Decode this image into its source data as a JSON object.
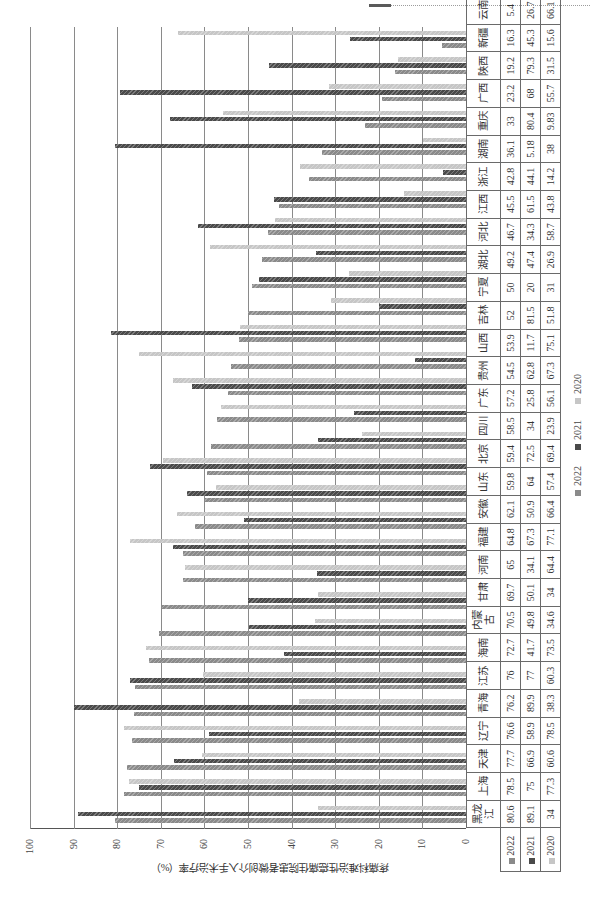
{
  "chart_data": {
    "type": "bar",
    "orientation": "grouped vertical bars; entire figure rotated 90° counter-clockwise on the page",
    "title": "",
    "xlabel": "",
    "ylabel": "疼痛科难治性癌痛住院患者微创介入手术治疗率（%）",
    "ylim": [
      0,
      100
    ],
    "yticks": [
      0,
      10,
      20,
      30,
      40,
      50,
      60,
      70,
      80,
      90,
      100
    ],
    "grid": true,
    "legend_position": "bottom",
    "data_table": true,
    "categories": [
      "黑龙江",
      "上海",
      "天津",
      "辽宁",
      "青海",
      "江苏",
      "海南",
      "内蒙古",
      "甘肃",
      "河南",
      "福建",
      "安徽",
      "山东",
      "北京",
      "四川",
      "广东",
      "贵州",
      "山西",
      "吉林",
      "宁夏",
      "湖北",
      "河北",
      "江西",
      "浙江",
      "湖南",
      "重庆",
      "广西",
      "陕西",
      "新疆",
      "云南"
    ],
    "series": [
      {
        "name": "2022",
        "color": "#8a8a8a",
        "values": [
          80.6,
          78.5,
          77.7,
          76.6,
          76.2,
          76,
          72.7,
          70.5,
          69.7,
          65,
          64.8,
          62.1,
          59.8,
          59.4,
          58.5,
          57.2,
          54.5,
          53.9,
          52,
          50,
          49.2,
          46.7,
          45.5,
          42.8,
          36.1,
          33,
          23.2,
          19.2,
          16.3,
          5.4
        ]
      },
      {
        "name": "2021",
        "color": "#4a4a4a",
        "values": [
          89.1,
          75,
          66.9,
          58.9,
          89.9,
          77,
          41.7,
          49.8,
          50.1,
          34.1,
          67.3,
          50.9,
          64,
          72.5,
          34,
          25.8,
          62.8,
          11.7,
          81.5,
          20,
          47.4,
          34.3,
          61.5,
          44.1,
          5.18,
          80.4,
          68,
          79.3,
          45.3,
          26.7
        ]
      },
      {
        "name": "2020",
        "color": "#c6c6c6",
        "values": [
          34,
          77.3,
          60.6,
          78.5,
          38.3,
          60.3,
          73.5,
          34.6,
          34,
          64.4,
          77.1,
          66.4,
          57.4,
          69.4,
          23.9,
          56.1,
          67.3,
          75.1,
          51.8,
          31,
          26.9,
          58.7,
          43.8,
          14.2,
          38,
          9.83,
          55.7,
          31.5,
          15.6,
          66.1
        ]
      }
    ]
  }
}
